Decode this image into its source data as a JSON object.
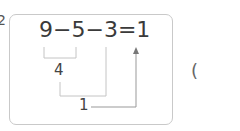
{
  "problem": {
    "index_mark": "2",
    "equation": {
      "a": "9",
      "op1": "−",
      "b": "5",
      "op2": "−",
      "c": "3",
      "eq": "=",
      "result": "1"
    },
    "step1_result": "4",
    "step2_result": "1",
    "answer_paren_open": "("
  },
  "colors": {
    "box_border": "#c9c9c9",
    "text": "#3a3a3a",
    "lines": "#bdbdbd"
  }
}
